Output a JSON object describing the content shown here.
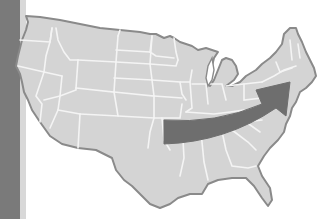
{
  "map": {
    "subject": "United States outline with state borders",
    "colors": {
      "land": "#d4d4d4",
      "border": "#f2f2f2",
      "coast": "#8a8a8a",
      "arrow": "#6e6e6e",
      "ocean_strip": "#7a7a7a",
      "background": "#ffffff"
    },
    "annotation": {
      "type": "arrow",
      "direction": "from south-central toward northeast",
      "description": "Curved arrow sweeping from the central states to the northeast coast"
    }
  }
}
